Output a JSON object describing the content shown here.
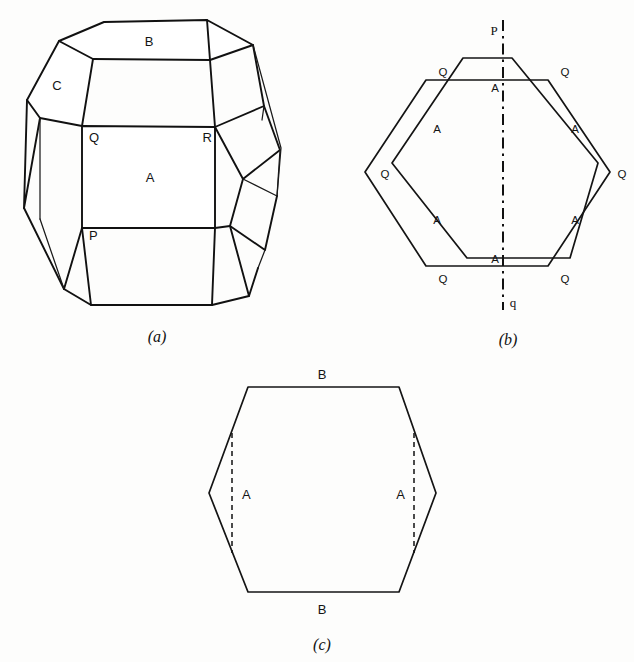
{
  "plate": {
    "title": "Crystal forms: truncated polyhedron and hexagonal sections",
    "background_color": "#fdfdfc",
    "line_color": "#111111"
  },
  "figures": [
    {
      "id": "a",
      "caption": "(a)",
      "description": "Perspective view of a truncated polyhedral crystal",
      "face_labels": [
        {
          "text": "B",
          "role": "top-face"
        },
        {
          "text": "C",
          "role": "upper-left-face"
        },
        {
          "text": "A",
          "role": "front-face"
        }
      ],
      "vertex_labels": [
        {
          "text": "Q",
          "role": "front-face-top-left"
        },
        {
          "text": "R",
          "role": "front-face-top-right"
        },
        {
          "text": "P",
          "role": "front-face-bottom-left"
        }
      ]
    },
    {
      "id": "b",
      "caption": "(b)",
      "description": "Two superimposed hexagonal outlines rotated relative to one another, with twin axis",
      "axis_labels": [
        {
          "text": "P",
          "role": "axis-top"
        },
        {
          "text": "q",
          "role": "axis-bottom"
        }
      ],
      "face_labels": [
        {
          "text": "A",
          "role": "upper-centre"
        },
        {
          "text": "A",
          "role": "upper-left"
        },
        {
          "text": "A",
          "role": "upper-right"
        },
        {
          "text": "A",
          "role": "lower-left"
        },
        {
          "text": "A",
          "role": "lower-right"
        },
        {
          "text": "A",
          "role": "lower-centre"
        }
      ],
      "vertex_labels": [
        {
          "text": "Q",
          "role": "top-left"
        },
        {
          "text": "Q",
          "role": "top-right"
        },
        {
          "text": "Q",
          "role": "middle-left"
        },
        {
          "text": "Q",
          "role": "middle-right"
        },
        {
          "text": "Q",
          "role": "bottom-left"
        },
        {
          "text": "Q",
          "role": "bottom-right"
        }
      ]
    },
    {
      "id": "c",
      "caption": "(c)",
      "description": "Single hexagonal outline with two vertical dashed chords",
      "face_labels": [
        {
          "text": "B",
          "role": "top-edge"
        },
        {
          "text": "B",
          "role": "bottom-edge"
        },
        {
          "text": "A",
          "role": "left-chord"
        },
        {
          "text": "A",
          "role": "right-chord"
        }
      ]
    }
  ]
}
